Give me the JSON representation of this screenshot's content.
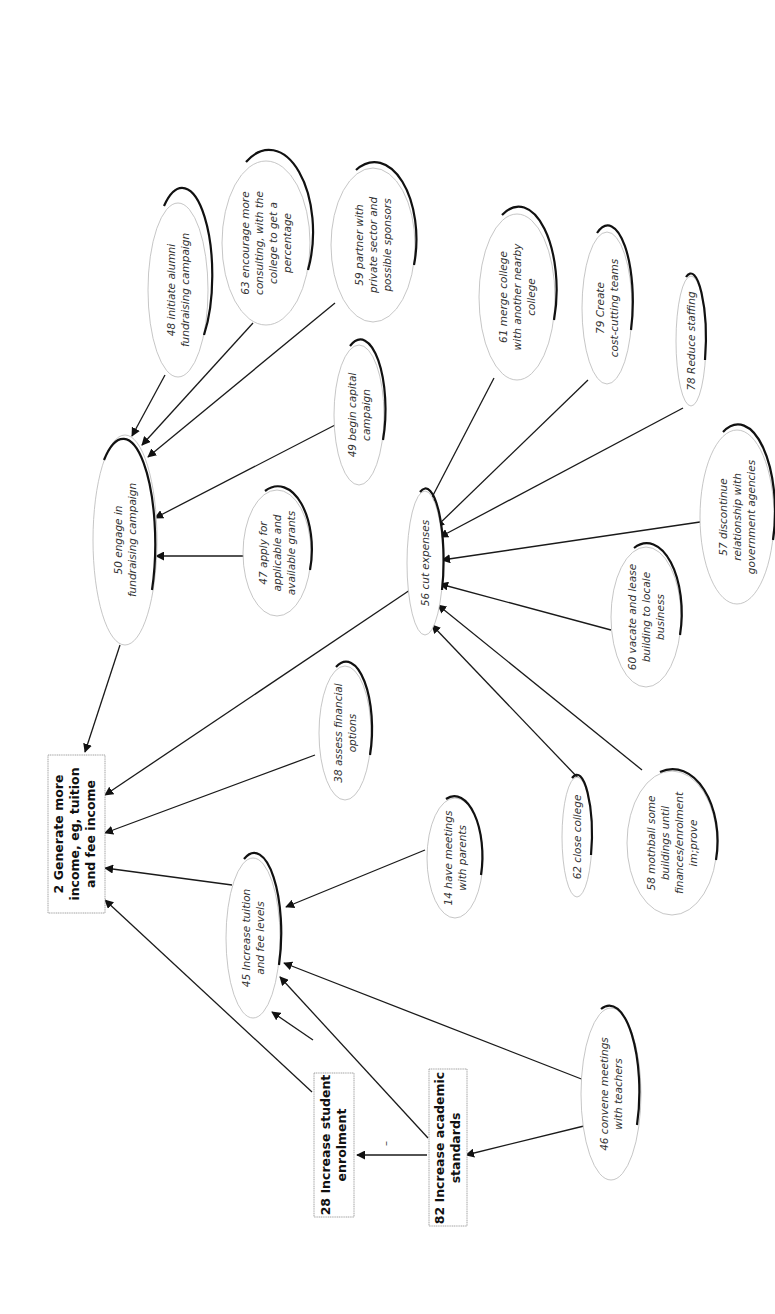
{
  "diagram": {
    "type": "cognitive map",
    "orientation": "rotated 90 degrees counter-clockwise",
    "goals": [
      {
        "id": "2",
        "label": "2 Generate more income, eg, tuition and fee income",
        "lines": [
          "2 Generate more",
          "income, eg, tuition",
          "and fee income"
        ]
      },
      {
        "id": "28",
        "label": "28 Increase student enrolment",
        "lines": [
          "28 Increase student",
          "enrolment"
        ]
      },
      {
        "id": "82",
        "label": "82 Increase academic standards",
        "lines": [
          "82 Increase academic",
          "standards"
        ]
      }
    ],
    "options": [
      {
        "id": "50",
        "lines": [
          "50 engage in",
          "fundraising campaign"
        ]
      },
      {
        "id": "48",
        "lines": [
          "48 initiate alumni",
          "fundraising campaign"
        ]
      },
      {
        "id": "63",
        "lines": [
          "63 encourage more",
          "consulting, with the",
          "college to get a",
          "percentage"
        ]
      },
      {
        "id": "59",
        "lines": [
          "59 partner with",
          "private sector and",
          "possible sponsors"
        ]
      },
      {
        "id": "49",
        "lines": [
          "49 begin capital",
          "campaign"
        ]
      },
      {
        "id": "47",
        "lines": [
          "47 apply for",
          "applicable and",
          "available grants"
        ]
      },
      {
        "id": "38",
        "lines": [
          "38 assess financial",
          "options"
        ]
      },
      {
        "id": "56",
        "lines": [
          "56 cut expenses"
        ]
      },
      {
        "id": "61",
        "lines": [
          "61 merge college",
          "with another nearby",
          "college"
        ]
      },
      {
        "id": "79",
        "lines": [
          "79 Create",
          "cost-cutting teams"
        ]
      },
      {
        "id": "78",
        "lines": [
          "78 Reduce staffing"
        ]
      },
      {
        "id": "57",
        "lines": [
          "57 discontinue",
          "relationship with",
          "government agencies"
        ]
      },
      {
        "id": "60",
        "lines": [
          "60 vacate and lease",
          "building to locale",
          "business"
        ]
      },
      {
        "id": "58",
        "lines": [
          "58 mothball some",
          "buildings until",
          "finances/enrolment",
          "im;prove"
        ]
      },
      {
        "id": "62",
        "lines": [
          "62 close college"
        ]
      },
      {
        "id": "45",
        "lines": [
          "45 Increase tuition",
          "and fee levels"
        ]
      },
      {
        "id": "14",
        "lines": [
          "14 have meetings",
          "with parents"
        ]
      },
      {
        "id": "46",
        "lines": [
          "46 convene meetings",
          "with teachers"
        ]
      }
    ],
    "links": [
      {
        "from": "50",
        "to": "2"
      },
      {
        "from": "48",
        "to": "50"
      },
      {
        "from": "63",
        "to": "50"
      },
      {
        "from": "59",
        "to": "50"
      },
      {
        "from": "49",
        "to": "50"
      },
      {
        "from": "47",
        "to": "50"
      },
      {
        "from": "56",
        "to": "2"
      },
      {
        "from": "38",
        "to": "2"
      },
      {
        "from": "45",
        "to": "2"
      },
      {
        "from": "28",
        "to": "2"
      },
      {
        "from": "61",
        "to": "56"
      },
      {
        "from": "79",
        "to": "56"
      },
      {
        "from": "78",
        "to": "56"
      },
      {
        "from": "57",
        "to": "56"
      },
      {
        "from": "60",
        "to": "56"
      },
      {
        "from": "58",
        "to": "56"
      },
      {
        "from": "62",
        "to": "56"
      },
      {
        "from": "14",
        "to": "45"
      },
      {
        "from": "46",
        "to": "45"
      },
      {
        "from": "46",
        "to": "82"
      },
      {
        "from": "28",
        "to": "45"
      },
      {
        "from": "82",
        "to": "45"
      },
      {
        "from": "82",
        "to": "28",
        "sign": "-"
      }
    ],
    "negative_sign": "–"
  }
}
